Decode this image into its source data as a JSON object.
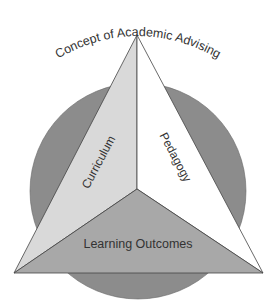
{
  "diagram": {
    "title": "Concept of Academic Advising",
    "faces": [
      {
        "id": "curriculum",
        "label": "Curriculum",
        "color": "#d9d9d9"
      },
      {
        "id": "pedagogy",
        "label": "Pedagogy",
        "color": "#ffffff"
      },
      {
        "id": "learning-outcomes",
        "label": "Learning Outcomes",
        "color": "#a8a8a8"
      }
    ],
    "circle_color": "#8c8c8c",
    "edge_color": "#444444",
    "text_color": "#333333"
  }
}
